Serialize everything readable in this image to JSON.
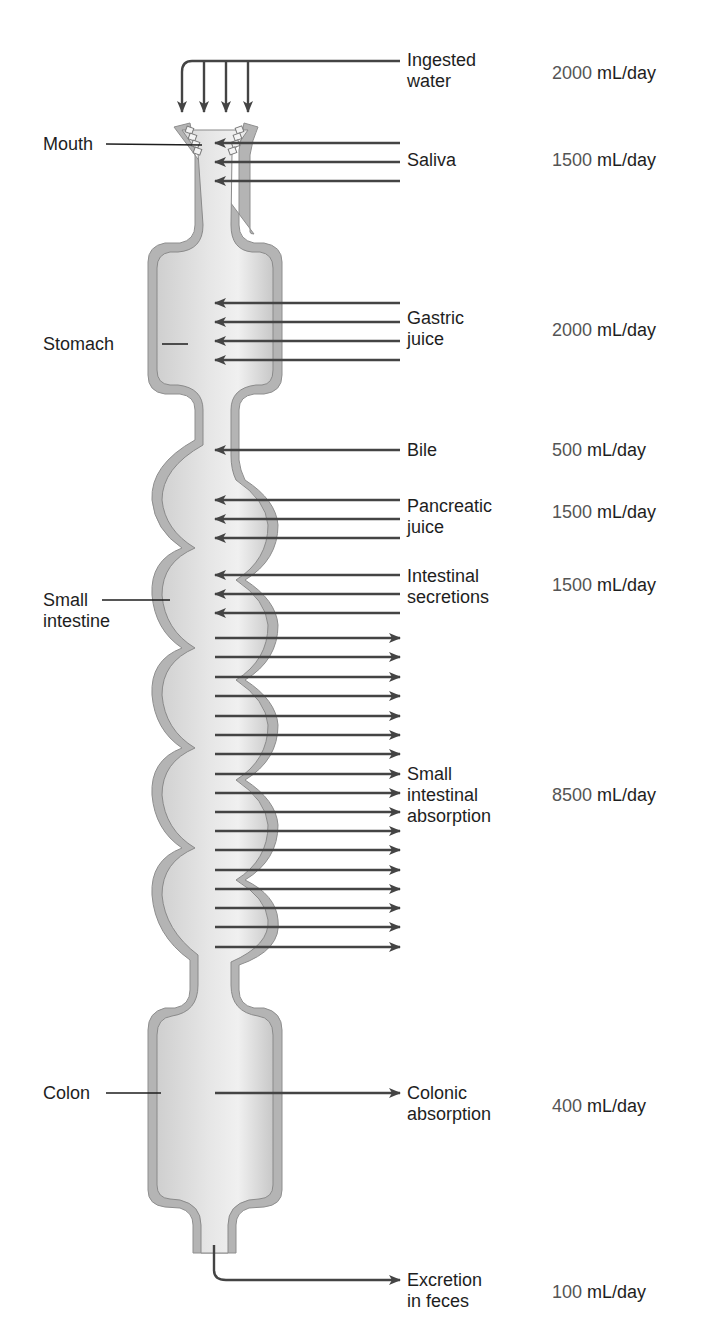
{
  "diagram": {
    "colors": {
      "tract_fill": "#dcdcdc",
      "tract_wall": "#a8a8a8",
      "wall_line": "#8a8a8a",
      "arrow": "#444444",
      "label_text": "#1e1e1e",
      "number_text": "#555555"
    },
    "organ_labels": [
      {
        "id": "mouth",
        "lines": [
          "Mouth"
        ]
      },
      {
        "id": "stomach",
        "lines": [
          "Stomach"
        ]
      },
      {
        "id": "small-intestine",
        "lines": [
          "Small",
          "intestine"
        ]
      },
      {
        "id": "colon",
        "lines": [
          "Colon"
        ]
      }
    ],
    "flows": [
      {
        "id": "ingested-water",
        "lines": [
          "Ingested",
          "water"
        ],
        "value": "2000",
        "unit": "mL/day",
        "direction": "in",
        "arrow_count": 4
      },
      {
        "id": "saliva",
        "lines": [
          "Saliva"
        ],
        "value": "1500",
        "unit": "mL/day",
        "direction": "in",
        "arrow_count": 3
      },
      {
        "id": "gastric-juice",
        "lines": [
          "Gastric",
          "juice"
        ],
        "value": "2000",
        "unit": "mL/day",
        "direction": "in",
        "arrow_count": 4
      },
      {
        "id": "bile",
        "lines": [
          "Bile"
        ],
        "value": "500",
        "unit": "mL/day",
        "direction": "in",
        "arrow_count": 1
      },
      {
        "id": "pancreatic-juice",
        "lines": [
          "Pancreatic",
          "juice"
        ],
        "value": "1500",
        "unit": "mL/day",
        "direction": "in",
        "arrow_count": 3
      },
      {
        "id": "intestinal-secretions",
        "lines": [
          "Intestinal",
          "secretions"
        ],
        "value": "1500",
        "unit": "mL/day",
        "direction": "in",
        "arrow_count": 3
      },
      {
        "id": "small-intestinal-absorption",
        "lines": [
          "Small",
          "intestinal",
          "absorption"
        ],
        "value": "8500",
        "unit": "mL/day",
        "direction": "out",
        "arrow_count": 17
      },
      {
        "id": "colonic-absorption",
        "lines": [
          "Colonic",
          "absorption"
        ],
        "value": "400",
        "unit": "mL/day",
        "direction": "out",
        "arrow_count": 1
      },
      {
        "id": "excretion-in-feces",
        "lines": [
          "Excretion",
          "in feces"
        ],
        "value": "100",
        "unit": "mL/day",
        "direction": "out",
        "arrow_count": 1
      }
    ]
  }
}
